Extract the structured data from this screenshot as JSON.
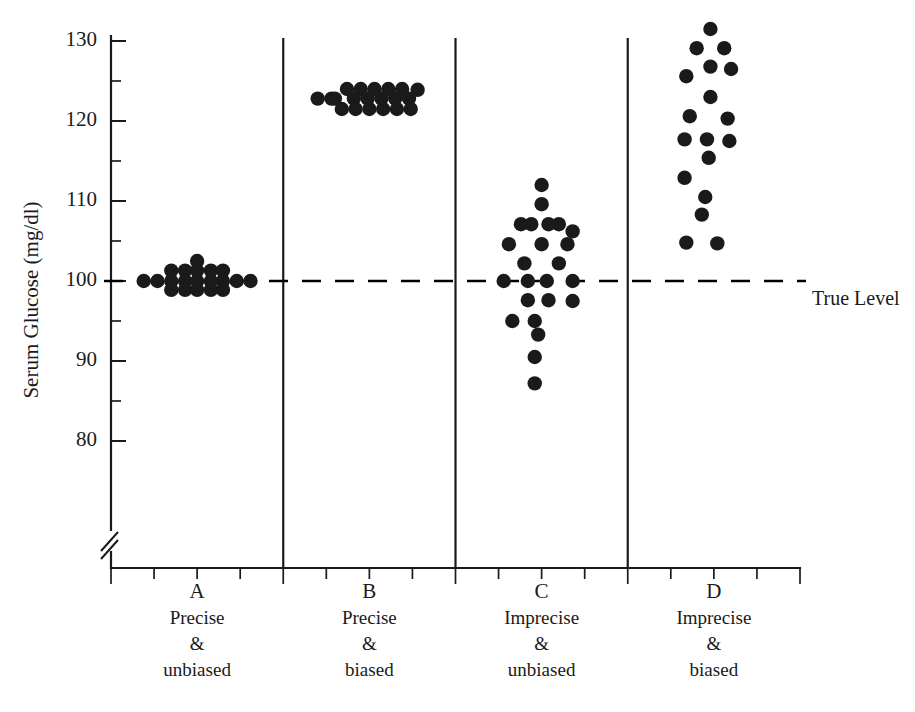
{
  "chart_data": {
    "type": "scatter",
    "title": "",
    "subtitle": "",
    "xlabel": "",
    "ylabel": "Serum Glucose (mg/dl)",
    "ylim": [
      78,
      133
    ],
    "xlim": [
      0,
      4
    ],
    "grid": false,
    "legend_position": "none",
    "y_tick_labels": [
      "130",
      "120",
      "110",
      "100",
      "90",
      "80"
    ],
    "y_tick_values": [
      130,
      120,
      110,
      100,
      90,
      80
    ],
    "y_minor_tick_values": [
      125,
      115,
      105,
      95,
      85
    ],
    "axis_break": true,
    "axis_break_note": "double-slash break on y-axis below 80",
    "annotations": [
      {
        "name": "true-level-line",
        "label": "True Level",
        "y_value": 100,
        "style": "dashed",
        "color": "#000000"
      }
    ],
    "categories": [
      "A",
      "B",
      "C",
      "D"
    ],
    "category_captions": [
      {
        "letter": "A",
        "line1": "Precise",
        "line2": "&",
        "line3": "unbiased"
      },
      {
        "letter": "B",
        "line1": "Precise",
        "line2": "&",
        "line3": "biased"
      },
      {
        "letter": "C",
        "line1": "Imprecise",
        "line2": "&",
        "line3": "unbiased"
      },
      {
        "letter": "D",
        "line1": "Imprecise",
        "line2": "&",
        "line3": "biased"
      }
    ],
    "series": [
      {
        "name": "A",
        "label": "Precise & unbiased",
        "n": 20,
        "center": 100,
        "points": [
          {
            "x": 0.5,
            "y": 102.5
          },
          {
            "x": 0.35,
            "y": 101.3
          },
          {
            "x": 0.43,
            "y": 101.3
          },
          {
            "x": 0.5,
            "y": 101.3
          },
          {
            "x": 0.58,
            "y": 101.3
          },
          {
            "x": 0.65,
            "y": 101.3
          },
          {
            "x": 0.19,
            "y": 100.0
          },
          {
            "x": 0.27,
            "y": 100.0
          },
          {
            "x": 0.35,
            "y": 100.0
          },
          {
            "x": 0.43,
            "y": 100.0
          },
          {
            "x": 0.5,
            "y": 100.0
          },
          {
            "x": 0.58,
            "y": 100.0
          },
          {
            "x": 0.65,
            "y": 100.0
          },
          {
            "x": 0.73,
            "y": 100.0
          },
          {
            "x": 0.81,
            "y": 100.0
          },
          {
            "x": 0.35,
            "y": 98.9
          },
          {
            "x": 0.43,
            "y": 98.9
          },
          {
            "x": 0.5,
            "y": 98.9
          },
          {
            "x": 0.58,
            "y": 98.9
          },
          {
            "x": 0.65,
            "y": 98.9
          }
        ]
      },
      {
        "name": "B",
        "label": "Precise & biased",
        "n": 20,
        "center": 122.8,
        "points": [
          {
            "x": 1.37,
            "y": 124.0
          },
          {
            "x": 1.45,
            "y": 124.0
          },
          {
            "x": 1.53,
            "y": 124.0
          },
          {
            "x": 1.61,
            "y": 124.0
          },
          {
            "x": 1.69,
            "y": 124.0
          },
          {
            "x": 1.2,
            "y": 122.8
          },
          {
            "x": 1.28,
            "y": 122.8
          },
          {
            "x": 1.41,
            "y": 122.8
          },
          {
            "x": 1.49,
            "y": 122.8
          },
          {
            "x": 1.57,
            "y": 122.8
          },
          {
            "x": 1.65,
            "y": 122.8
          },
          {
            "x": 1.73,
            "y": 122.8
          },
          {
            "x": 1.34,
            "y": 121.5
          },
          {
            "x": 1.42,
            "y": 121.5
          },
          {
            "x": 1.5,
            "y": 121.5
          },
          {
            "x": 1.58,
            "y": 121.5
          },
          {
            "x": 1.66,
            "y": 121.5
          },
          {
            "x": 1.74,
            "y": 121.5
          },
          {
            "x": 1.3,
            "y": 122.8
          },
          {
            "x": 1.78,
            "y": 123.9
          }
        ]
      },
      {
        "name": "C",
        "label": "Imprecise & unbiased",
        "n": 24,
        "center": 100,
        "points": [
          {
            "x": 2.5,
            "y": 112.0
          },
          {
            "x": 2.5,
            "y": 109.6
          },
          {
            "x": 2.38,
            "y": 107.1
          },
          {
            "x": 2.44,
            "y": 107.1
          },
          {
            "x": 2.54,
            "y": 107.1
          },
          {
            "x": 2.6,
            "y": 107.1
          },
          {
            "x": 2.68,
            "y": 106.2
          },
          {
            "x": 2.31,
            "y": 104.6
          },
          {
            "x": 2.5,
            "y": 104.6
          },
          {
            "x": 2.65,
            "y": 104.6
          },
          {
            "x": 2.4,
            "y": 102.2
          },
          {
            "x": 2.6,
            "y": 102.2
          },
          {
            "x": 2.28,
            "y": 100.0
          },
          {
            "x": 2.42,
            "y": 100.0
          },
          {
            "x": 2.53,
            "y": 100.0
          },
          {
            "x": 2.68,
            "y": 100.0
          },
          {
            "x": 2.42,
            "y": 97.6
          },
          {
            "x": 2.54,
            "y": 97.6
          },
          {
            "x": 2.68,
            "y": 97.5
          },
          {
            "x": 2.33,
            "y": 95.0
          },
          {
            "x": 2.46,
            "y": 95.0
          },
          {
            "x": 2.48,
            "y": 93.3
          },
          {
            "x": 2.46,
            "y": 90.5
          },
          {
            "x": 2.46,
            "y": 87.2
          }
        ]
      },
      {
        "name": "D",
        "label": "Imprecise & biased",
        "n": 20,
        "center": 118,
        "points": [
          {
            "x": 3.48,
            "y": 131.5
          },
          {
            "x": 3.4,
            "y": 129.1
          },
          {
            "x": 3.56,
            "y": 129.1
          },
          {
            "x": 3.48,
            "y": 126.8
          },
          {
            "x": 3.6,
            "y": 126.5
          },
          {
            "x": 3.34,
            "y": 125.6
          },
          {
            "x": 3.48,
            "y": 123.0
          },
          {
            "x": 3.36,
            "y": 120.6
          },
          {
            "x": 3.58,
            "y": 120.3
          },
          {
            "x": 3.33,
            "y": 117.7
          },
          {
            "x": 3.46,
            "y": 117.7
          },
          {
            "x": 3.59,
            "y": 117.5
          },
          {
            "x": 3.47,
            "y": 115.4
          },
          {
            "x": 3.33,
            "y": 112.9
          },
          {
            "x": 3.45,
            "y": 110.5
          },
          {
            "x": 3.43,
            "y": 108.3
          },
          {
            "x": 3.34,
            "y": 104.8
          },
          {
            "x": 3.52,
            "y": 104.7
          }
        ]
      }
    ]
  }
}
